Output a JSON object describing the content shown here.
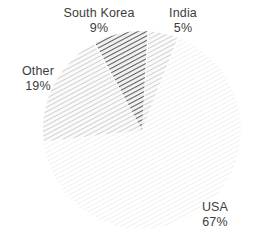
{
  "chart_data": {
    "type": "pie",
    "title": "",
    "categories": [
      "USA",
      "Other",
      "South Korea",
      "India"
    ],
    "values": [
      67,
      19,
      9,
      5
    ],
    "unit": "%",
    "legend_position": "none",
    "labels": [
      {
        "name": "South Korea",
        "value": "9%",
        "pct": 9,
        "fill": "dark-diagonal-hatch"
      },
      {
        "name": "India",
        "value": "5%",
        "pct": 5,
        "fill": "light-diagonal-hatch"
      },
      {
        "name": "Other",
        "value": "19%",
        "pct": 19,
        "fill": "light-diagonal-hatch"
      },
      {
        "name": "USA",
        "value": "67%",
        "pct": 67,
        "fill": "faint-diagonal-hatch"
      }
    ],
    "colors": {
      "background": "#ffffff",
      "text": "#3d3d3d",
      "slice_dark": "#6e6e6e",
      "slice_light": "#c9c9c9",
      "slice_faint": "#ededed",
      "gap": "#ffffff"
    }
  },
  "geometry": {
    "center_x": 142,
    "center_y": 130,
    "radius": 99
  }
}
